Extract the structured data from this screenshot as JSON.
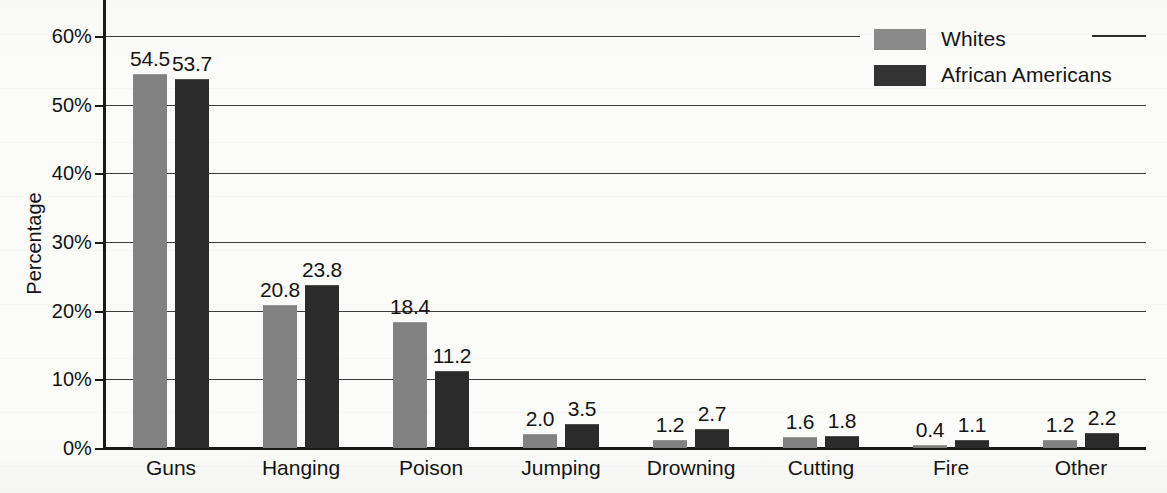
{
  "chart_data": {
    "type": "bar",
    "title": "",
    "subtitle": "",
    "xlabel": "",
    "ylabel": "Percentage",
    "ylim": [
      0,
      60
    ],
    "ytick_labels": [
      "0%",
      "10%",
      "20%",
      "30%",
      "40%",
      "50%",
      "60%"
    ],
    "ytick_values": [
      0,
      10,
      20,
      30,
      40,
      50,
      60
    ],
    "grid": true,
    "grid_axis": "y",
    "legend_position": "top-right",
    "value_labels": true,
    "value_label_format": "one-decimal",
    "categories": [
      "Guns",
      "Hanging",
      "Poison",
      "Jumping",
      "Drowning",
      "Cutting",
      "Fire",
      "Other"
    ],
    "series": [
      {
        "name": "Whites",
        "color": "#828282",
        "values": [
          54.5,
          20.8,
          18.4,
          2.0,
          1.2,
          1.6,
          0.4,
          1.2
        ],
        "value_labels": [
          "54.5",
          "20.8",
          "18.4",
          "2.0",
          "1.2",
          "1.6",
          "0.4",
          "1.2"
        ]
      },
      {
        "name": "African Americans",
        "color": "#2b2b2b",
        "values": [
          53.7,
          23.8,
          11.2,
          3.5,
          2.7,
          1.8,
          1.1,
          2.2
        ],
        "value_labels": [
          "53.7",
          "23.8",
          "11.2",
          "3.5",
          "2.7",
          "1.8",
          "1.1",
          "2.2"
        ]
      }
    ]
  },
  "legend": {
    "entries": [
      {
        "label": "Whites",
        "color": "#8a8a8a"
      },
      {
        "label": "African Americans",
        "color": "#333333"
      }
    ]
  },
  "axis": {
    "y_title": "Percentage"
  }
}
